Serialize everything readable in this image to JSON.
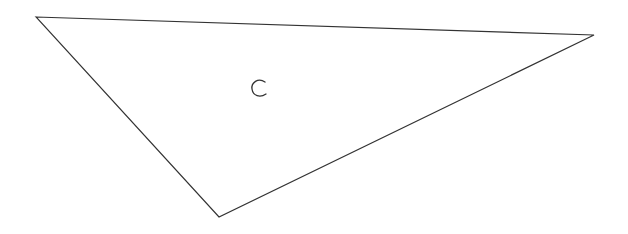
{
  "diagram": {
    "type": "triangle",
    "stroke_color": "#333333",
    "fill_color": "#ffffff",
    "vertices": [
      {
        "x": 36,
        "y": 17
      },
      {
        "x": 594,
        "y": 35
      },
      {
        "x": 219,
        "y": 217
      }
    ],
    "label": {
      "text": "C",
      "x": 258,
      "y": 94
    }
  }
}
